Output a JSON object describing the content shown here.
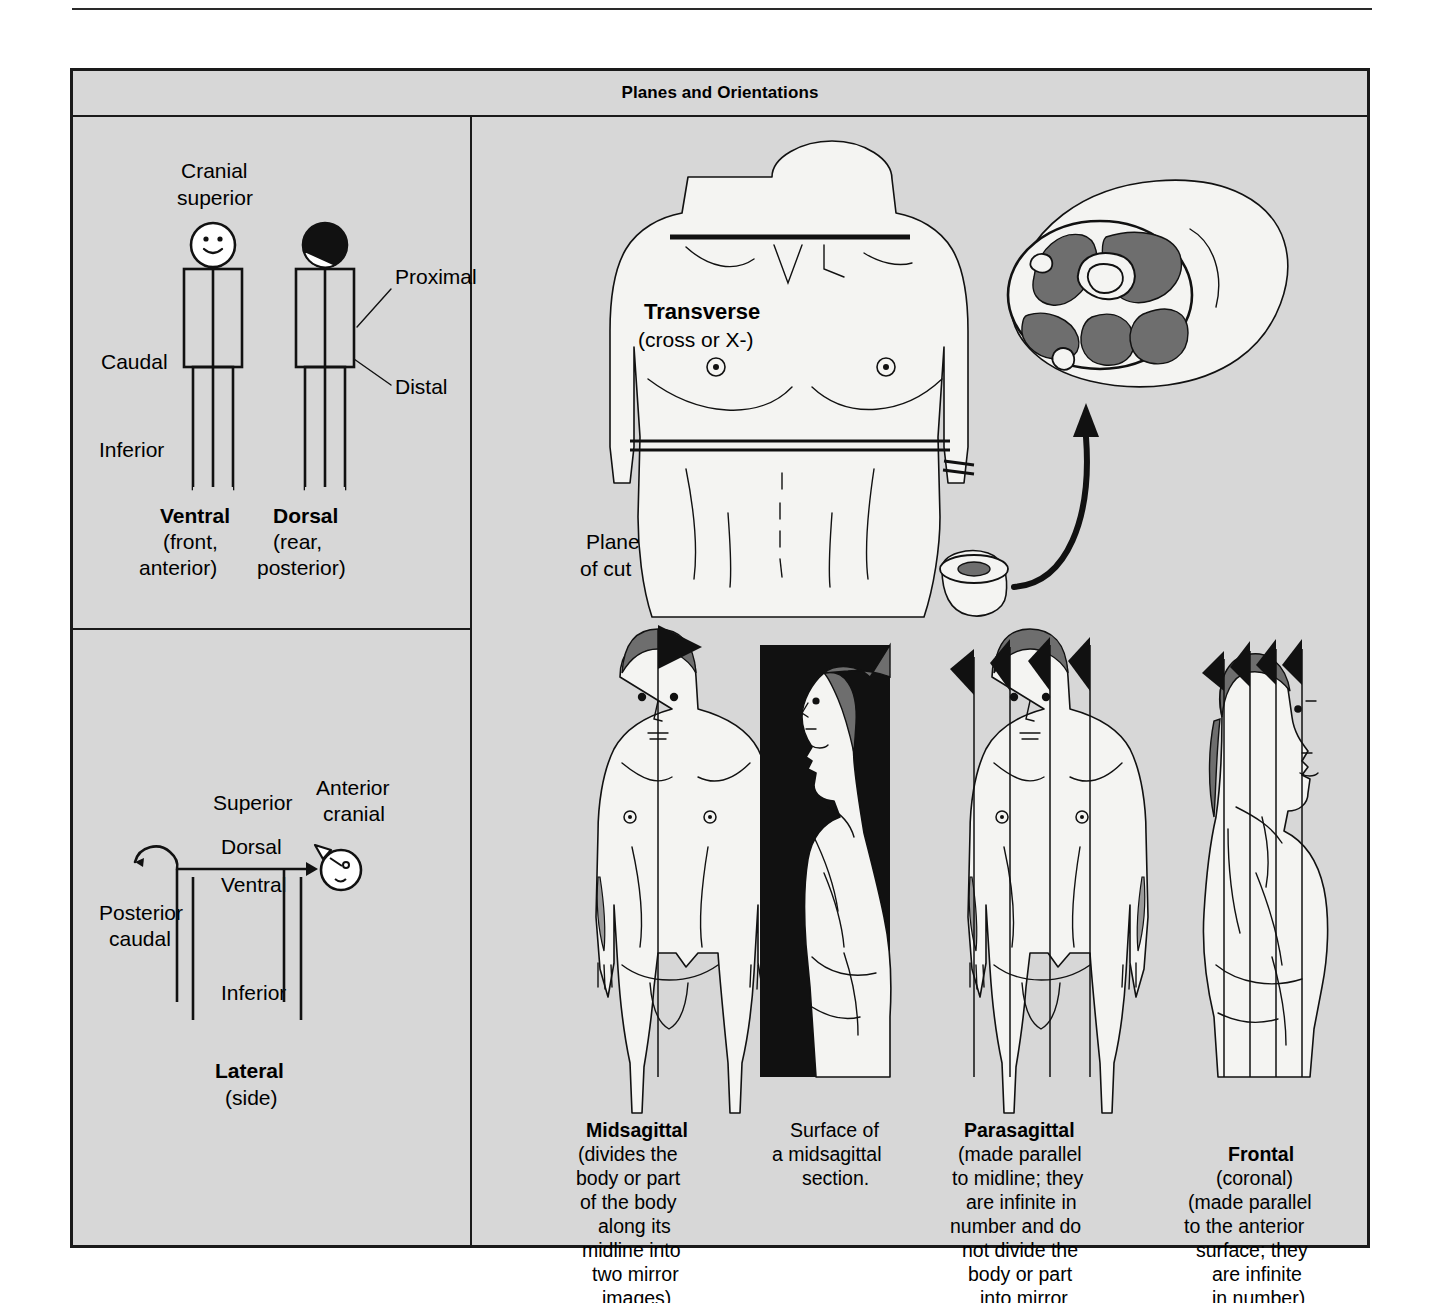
{
  "figure": {
    "title": "Planes and Orientations",
    "background_color": "#d7d7d7",
    "frame_color": "#1a1a1a"
  },
  "panels": {
    "ventral_dorsal": {
      "name": "ventral-dorsal-panel",
      "labels": {
        "cranial": "Cranial",
        "superior": "superior",
        "caudal": "Caudal",
        "inferior": "Inferior",
        "proximal": "Proximal",
        "distal": "Distal"
      },
      "figures": [
        {
          "title": "Ventral",
          "sub1": "(front,",
          "sub2": "anterior)"
        },
        {
          "title": "Dorsal",
          "sub1": "(rear,",
          "sub2": "posterior)"
        }
      ]
    },
    "lateral": {
      "name": "lateral-panel",
      "labels": {
        "superior": "Superior",
        "anterior": "Anterior",
        "cranial": "cranial",
        "dorsal": "Dorsal",
        "ventral": "Ventral",
        "posterior": "Posterior",
        "caudal": "caudal",
        "inferior": "Inferior"
      },
      "title": "Lateral",
      "subtitle": "(side)"
    },
    "transverse": {
      "name": "transverse-panel",
      "title": "Transverse",
      "subtitle": "(cross or X-)"
    },
    "planes": {
      "plane_of_cut_line1": "Plane",
      "plane_of_cut_line2": "of cut",
      "items": [
        {
          "name": "midsagittal",
          "title": "Midsagittal",
          "caption_lines": [
            "(divides the",
            "body or part",
            "of the body",
            "along its",
            "midline into",
            "two mirror",
            "images)"
          ]
        },
        {
          "name": "midsagittal-surface",
          "title": "",
          "caption_lines": [
            "Surface of",
            "a midsagittal",
            "section."
          ]
        },
        {
          "name": "parasagittal",
          "title": "Parasagittal",
          "caption_lines": [
            "(made parallel",
            "to midline; they",
            "are infinite in",
            "number and do",
            "not divide the",
            "body or part",
            "into mirror",
            "images)"
          ]
        },
        {
          "name": "frontal",
          "title": "Frontal",
          "caption_lines": [
            "(coronal)",
            "(made parallel",
            "to the anterior",
            "surface; they",
            "are infinite",
            "in number)"
          ]
        }
      ]
    }
  }
}
